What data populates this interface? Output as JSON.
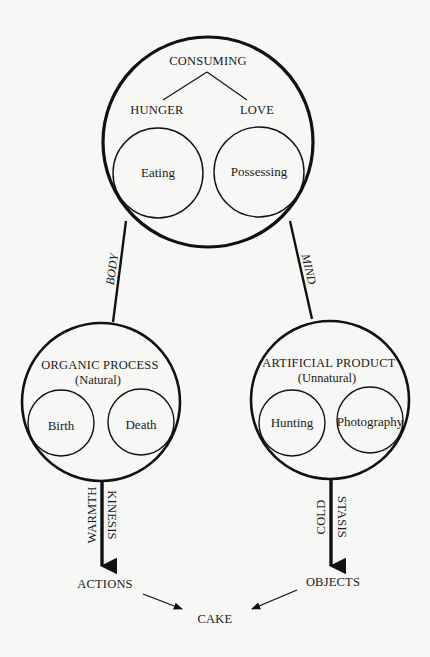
{
  "diagram": {
    "top": {
      "title": "CONSUMING",
      "left_branch": "HUNGER",
      "right_branch": "LOVE",
      "left_inner": "Eating",
      "right_inner": "Possessing"
    },
    "connectors": {
      "left_label": "BODY",
      "right_label": "MIND"
    },
    "left": {
      "title": "ORGANIC PROCESS",
      "subtitle": "(Natural)",
      "left_inner": "Birth",
      "right_inner": "Death",
      "arrow_label_a": "WARMTH",
      "arrow_label_b": "KINESIS",
      "result": "ACTIONS"
    },
    "right": {
      "title": "ARTIFICIAL PRODUCT",
      "subtitle": "(Unnatural)",
      "left_inner": "Hunting",
      "right_inner": "Photography",
      "arrow_label_a": "COLD",
      "arrow_label_b": "STASIS",
      "result": "OBJECTS"
    },
    "final": "CAKE",
    "colors": {
      "background": "#f7f7f5",
      "ink": "#111111"
    }
  }
}
